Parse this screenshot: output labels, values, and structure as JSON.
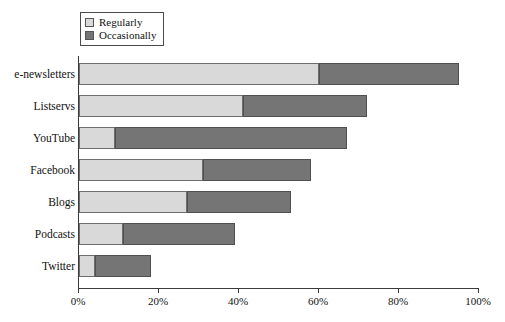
{
  "legend": {
    "position": "top-left",
    "items": [
      {
        "label": "Regularly",
        "color": "#d9d9d9",
        "swatch_name": "legend-swatch-regularly"
      },
      {
        "label": "Occasionally",
        "color": "#757575",
        "swatch_name": "legend-swatch-occasionally"
      }
    ]
  },
  "axis": {
    "x_ticks": [
      "0%",
      "20%",
      "40%",
      "60%",
      "80%",
      "100%"
    ],
    "x_tick_values": [
      0,
      20,
      40,
      60,
      80,
      100
    ]
  },
  "chart_data": {
    "type": "bar",
    "orientation": "horizontal",
    "stacked": true,
    "title": "",
    "subtitle": "",
    "xlabel": "",
    "ylabel": "",
    "xlim": [
      0,
      100
    ],
    "grid": false,
    "legend_position": "top-left",
    "categories": [
      "e-newsletters",
      "Listservs",
      "YouTube",
      "Facebook",
      "Blogs",
      "Podcasts",
      "Twitter"
    ],
    "series": [
      {
        "name": "Regularly",
        "color": "#d9d9d9",
        "values": [
          60,
          41,
          9,
          31,
          27,
          11,
          4
        ]
      },
      {
        "name": "Occasionally",
        "color": "#757575",
        "values": [
          35,
          31,
          58,
          27,
          26,
          28,
          14
        ]
      }
    ],
    "totals": [
      95,
      72,
      67,
      58,
      53,
      39,
      18
    ],
    "units": "percent"
  }
}
